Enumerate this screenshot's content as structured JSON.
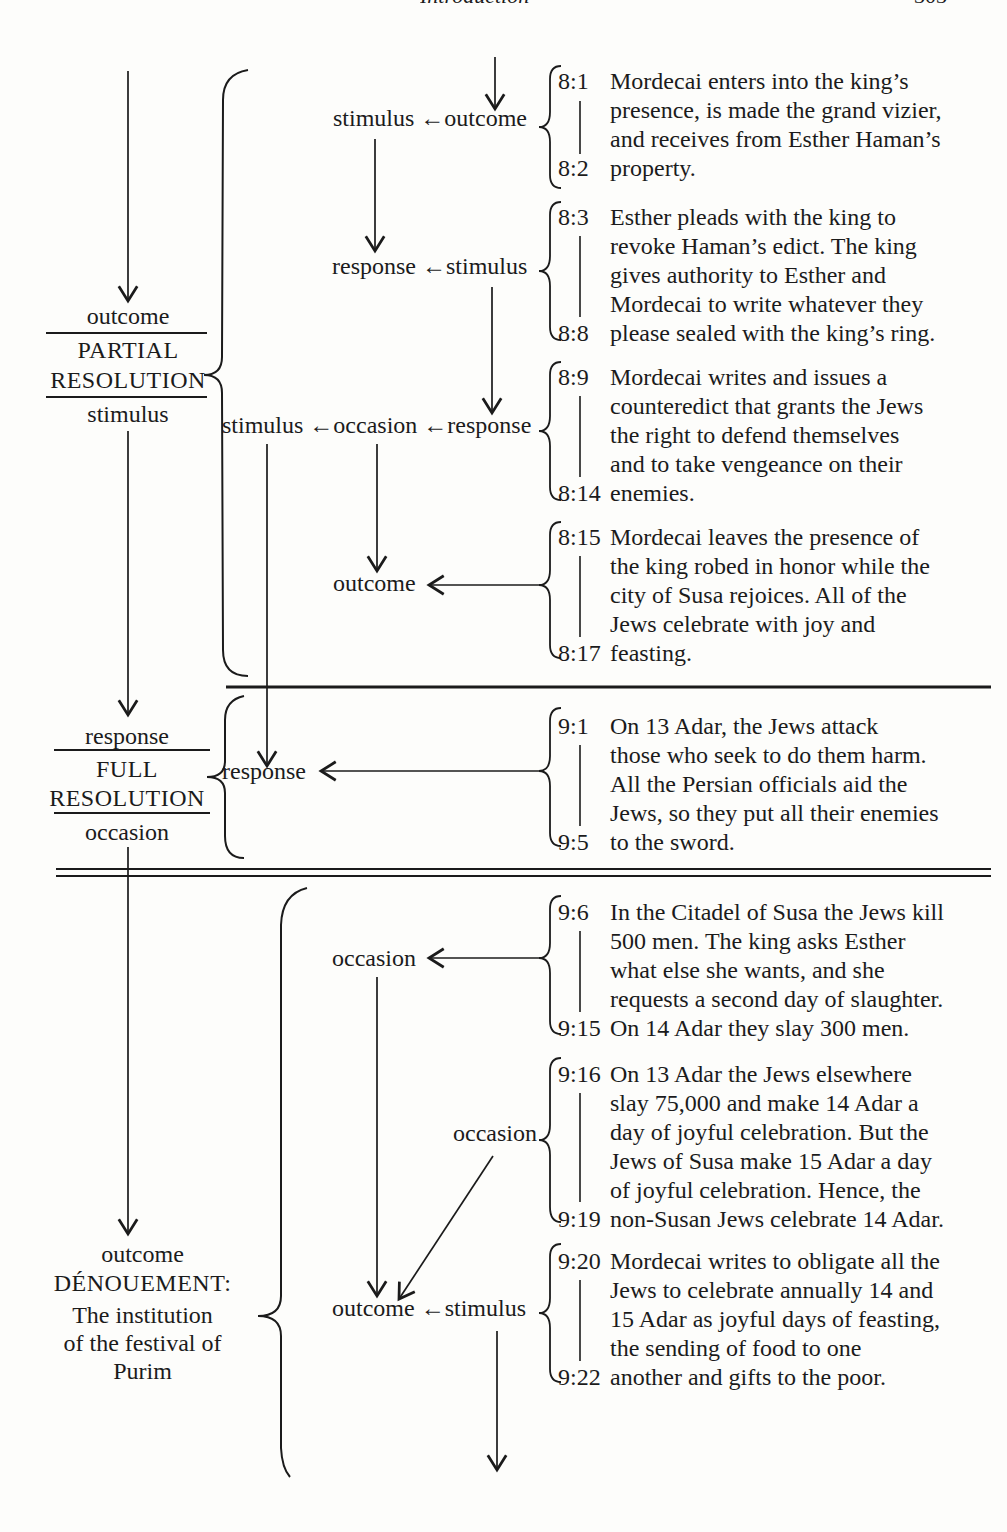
{
  "header": {
    "title": "Introduction",
    "page_number": "303"
  },
  "colors": {
    "paper": "#fdfdfb",
    "ink": "#1b1b1b"
  },
  "left_sections": [
    {
      "pre": "outcome",
      "title_line1": "PARTIAL",
      "title_line2": "RESOLUTION",
      "post": "stimulus"
    },
    {
      "pre": "response",
      "title_line1": "FULL",
      "title_line2": "RESOLUTION",
      "post": "occasion"
    },
    {
      "pre": "outcome",
      "title": "DÉNOUEMENT:",
      "subtitle_line1": "The institution",
      "subtitle_line2": "of the festival of",
      "subtitle_line3": "Purim"
    }
  ],
  "flow_labels": {
    "row1": "stimulus ←outcome",
    "row2": "response ←stimulus",
    "row3": "stimulus ←occasion ←response",
    "row4": "outcome",
    "row5": "response",
    "row6": "occasion",
    "row7": "occasion",
    "row8": "outcome ←stimulus"
  },
  "verse_blocks": [
    {
      "start": "8:1",
      "end": "8:2",
      "text": "Mordecai enters into the king’s\npresence, is made the grand vizier,\nand receives from Esther Haman’s\nproperty."
    },
    {
      "start": "8:3",
      "end": "8:8",
      "text": "Esther pleads with the king to\nrevoke Haman’s edict. The king\ngives authority to Esther and\nMordecai to write whatever they\nplease sealed with the king’s ring."
    },
    {
      "start": "8:9",
      "end": "8:14",
      "text": "Mordecai writes and issues a\ncounteredict that grants the Jews\nthe right to defend themselves\nand to take vengeance on their\nenemies."
    },
    {
      "start": "8:15",
      "end": "8:17",
      "text": "Mordecai leaves the presence of\nthe king robed in honor while the\ncity of Susa rejoices. All of the\nJews celebrate with joy and\nfeasting."
    },
    {
      "start": "9:1",
      "end": "9:5",
      "text": "On 13 Adar, the Jews attack\nthose who seek to do them harm.\nAll the Persian officials aid the\nJews, so they put all their enemies\nto the sword."
    },
    {
      "start": "9:6",
      "end": "9:15",
      "text": "In the Citadel of Susa the Jews kill\n500 men. The king asks Esther\nwhat else she wants, and she\nrequests a second day of slaughter.\nOn 14 Adar they slay 300 men."
    },
    {
      "start": "9:16",
      "end": "9:19",
      "text": "On 13 Adar the Jews elsewhere\nslay 75,000 and make 14 Adar a\nday of joyful celebration. But the\nJews of Susa make 15 Adar a day\nof joyful celebration. Hence, the\nnon-Susan Jews celebrate 14 Adar."
    },
    {
      "start": "9:20",
      "end": "9:22",
      "text": "Mordecai writes to obligate all the\nJews to celebrate annually 14 and\n15 Adar as joyful days of feasting,\nthe sending of food to one\nanother and gifts to the poor."
    }
  ]
}
